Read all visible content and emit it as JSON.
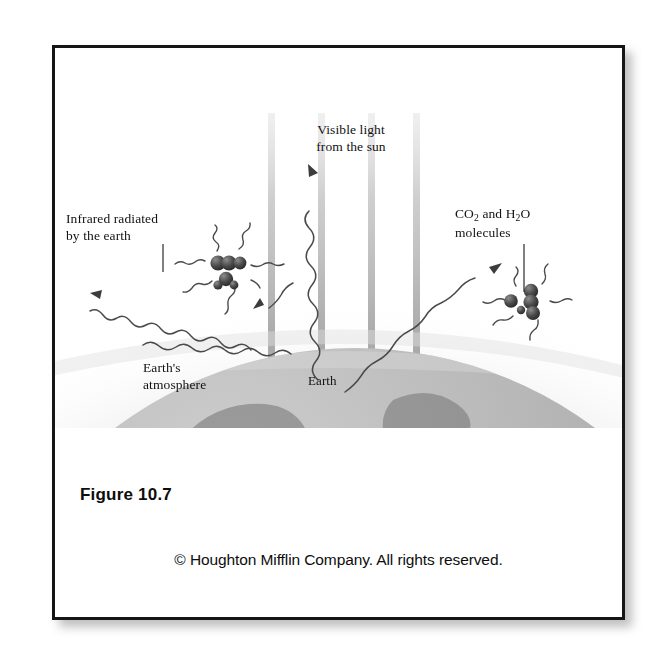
{
  "figure": {
    "number_label": "Figure 10.7",
    "copyright": "© Houghton Mifflin Company. All rights reserved.",
    "topic": "greenhouse-effect-diagram"
  },
  "labels": {
    "visible_light": "Visible light\nfrom the sun",
    "infrared": "Infrared radiated\nby the earth",
    "co2_prefix": "CO",
    "co2_sub": "2",
    "co2_mid": " and H",
    "h2o_sub": "2",
    "co2_suffix": "O",
    "co2_line2": "molecules",
    "atmosphere": "Earth's\natmosphere",
    "earth": "Earth"
  },
  "colors": {
    "border": "#151515",
    "card_background": "#ffffff",
    "text": "#121212",
    "beam": "#b9b9b9",
    "globe_ocean": "#b4b4b4",
    "globe_land": "#8f8f8f",
    "atmosphere_glow": "#d8d8d8",
    "wave_stroke": "#4a4a4a",
    "molecule_dark": "#3a3a3a"
  },
  "diagram": {
    "sun_beams": {
      "count": 4,
      "x_positions": [
        216,
        266,
        316,
        361
      ],
      "top": 65,
      "bottom": 340,
      "width": 7
    },
    "molecule_clusters": [
      {
        "name": "left-molecule-cluster",
        "cx": 170,
        "cy": 215,
        "ray_count": 7
      },
      {
        "name": "right-molecule-cluster",
        "cx": 470,
        "cy": 253,
        "ray_count": 6
      }
    ],
    "infrared_waves": [
      {
        "name": "wave-to-upper-left",
        "direction": "up-left",
        "has_arrowhead": true
      },
      {
        "name": "wave-escaping-vertical",
        "direction": "up",
        "has_arrowhead": true
      },
      {
        "name": "wave-to-right-cluster",
        "direction": "up-right",
        "has_arrowhead": true
      },
      {
        "name": "wave-lower-left",
        "direction": "up-left",
        "has_arrowhead": false
      }
    ],
    "globe": {
      "cx": 300,
      "cy": 700,
      "r": 400,
      "horizon_y": 300
    }
  }
}
